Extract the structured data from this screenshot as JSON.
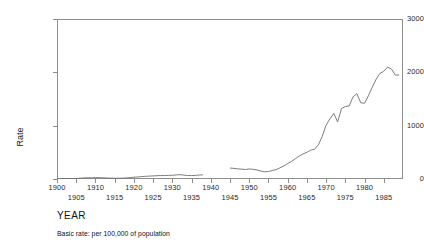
{
  "chart_data": {
    "type": "line",
    "title": "",
    "xlabel": "YEAR",
    "ylabel": "Rate",
    "caption": "Basic rate: per 100,000 of population",
    "xlim": [
      1900,
      1990
    ],
    "ylim": [
      0,
      3000
    ],
    "yticks": [
      0,
      1000,
      2000,
      3000
    ],
    "ytick_labels": [
      "0",
      "1000",
      "2000",
      "3000"
    ],
    "xticks": [
      1900,
      1905,
      1910,
      1915,
      1920,
      1925,
      1930,
      1935,
      1940,
      1945,
      1950,
      1955,
      1960,
      1965,
      1970,
      1975,
      1980,
      1985
    ],
    "xtick_labels_row_a": [
      {
        "year": 1900,
        "label": "1900"
      },
      {
        "year": 1910,
        "label": "1910"
      },
      {
        "year": 1920,
        "label": "1920"
      },
      {
        "year": 1930,
        "label": "1930"
      },
      {
        "year": 1940,
        "label": "1940"
      },
      {
        "year": 1950,
        "label": "1950"
      },
      {
        "year": 1960,
        "label": "1960"
      },
      {
        "year": 1970,
        "label": "1970"
      },
      {
        "year": 1980,
        "label": "1980"
      }
    ],
    "xtick_labels_row_b": [
      {
        "year": 1905,
        "label": "1905"
      },
      {
        "year": 1915,
        "label": "1915"
      },
      {
        "year": 1925,
        "label": "1925"
      },
      {
        "year": 1935,
        "label": "1935"
      },
      {
        "year": 1945,
        "label": "1945"
      },
      {
        "year": 1955,
        "label": "1955"
      },
      {
        "year": 1965,
        "label": "1965"
      },
      {
        "year": 1975,
        "label": "1975"
      },
      {
        "year": 1985,
        "label": "1985"
      }
    ],
    "grid": false,
    "legend": null,
    "line_color": "#6e6e6e",
    "line_width": 0.9,
    "gap_years": [
      1939,
      1940,
      1941,
      1942,
      1943,
      1944
    ],
    "series": [
      {
        "name": "Rate per 100,000 (pre-war)",
        "x": [
          1900,
          1901,
          1902,
          1903,
          1904,
          1905,
          1906,
          1907,
          1908,
          1909,
          1910,
          1911,
          1912,
          1913,
          1914,
          1915,
          1916,
          1917,
          1918,
          1919,
          1920,
          1921,
          1922,
          1923,
          1924,
          1925,
          1926,
          1927,
          1928,
          1929,
          1930,
          1931,
          1932,
          1933,
          1934,
          1935,
          1936,
          1937,
          1938
        ],
        "values": [
          6,
          6,
          7,
          8,
          9,
          10,
          14,
          20,
          24,
          22,
          26,
          25,
          22,
          18,
          16,
          14,
          14,
          16,
          20,
          26,
          34,
          38,
          44,
          50,
          54,
          58,
          62,
          64,
          66,
          68,
          70,
          76,
          82,
          72,
          66,
          64,
          68,
          74,
          80
        ]
      },
      {
        "name": "Rate per 100,000 (post-war)",
        "x": [
          1945,
          1946,
          1947,
          1948,
          1949,
          1950,
          1951,
          1952,
          1953,
          1954,
          1955,
          1956,
          1957,
          1958,
          1959,
          1960,
          1961,
          1962,
          1963,
          1964,
          1965,
          1966,
          1967,
          1968,
          1969,
          1970,
          1971,
          1972,
          1973,
          1974,
          1975,
          1976,
          1977,
          1978,
          1979,
          1980,
          1981,
          1982,
          1983,
          1984,
          1985,
          1986,
          1987,
          1988,
          1989
        ],
        "values": [
          205,
          200,
          190,
          185,
          178,
          188,
          182,
          170,
          150,
          135,
          140,
          160,
          175,
          210,
          245,
          290,
          330,
          380,
          430,
          470,
          500,
          540,
          560,
          640,
          800,
          1010,
          1130,
          1230,
          1070,
          1320,
          1360,
          1370,
          1540,
          1600,
          1430,
          1420,
          1560,
          1720,
          1870,
          1980,
          2020,
          2100,
          2060,
          1950,
          1950
        ]
      }
    ]
  },
  "y_axis_title": "Rate",
  "x_axis_title": "YEAR",
  "footnote": "Basic rate: per 100,000 of population"
}
